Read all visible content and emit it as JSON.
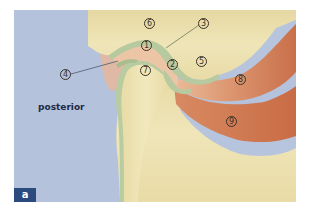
{
  "figure": {
    "panel_letter": "a",
    "orientation_label": "posterior",
    "colors": {
      "soft_tissue_blue": "#b4c2dc",
      "bone_cream": "#ece2b0",
      "bone_shadow": "#e0d29a",
      "disc_pink": "#ecc4a6",
      "cartilage_green": "#b7c99e",
      "muscle_upper": "#d98c66",
      "muscle_lower": "#cc764e",
      "badge_navy": "#2b4a7e",
      "label_ink": "#3a3226"
    },
    "labels": [
      {
        "id": "1",
        "text": "1"
      },
      {
        "id": "2",
        "text": "2"
      },
      {
        "id": "3",
        "text": "3"
      },
      {
        "id": "4",
        "text": "4"
      },
      {
        "id": "5",
        "text": "5"
      },
      {
        "id": "6",
        "text": "6"
      },
      {
        "id": "7",
        "text": "7"
      },
      {
        "id": "8",
        "text": "8"
      },
      {
        "id": "9",
        "text": "9"
      }
    ]
  }
}
